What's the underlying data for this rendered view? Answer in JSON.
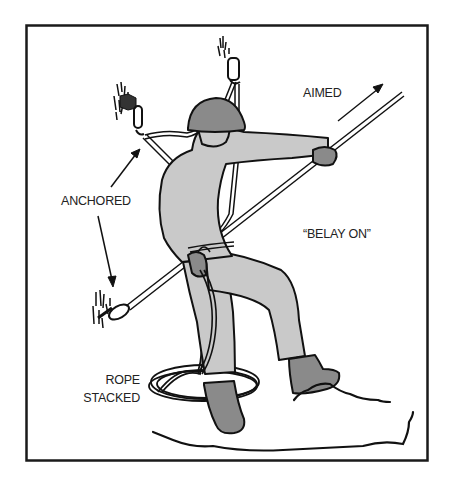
{
  "figure": {
    "colors": {
      "border": "#1a1a1a",
      "outline": "#111111",
      "clothing": "#c9c9c9",
      "helmet_gloves_boots": "#8a8a8a",
      "background": "#ffffff"
    }
  },
  "labels": {
    "aimed": "AIMED",
    "anchored": "ANCHORED",
    "belay_on": "“BELAY ON”",
    "rope": "ROPE",
    "stacked": "STACKED"
  }
}
